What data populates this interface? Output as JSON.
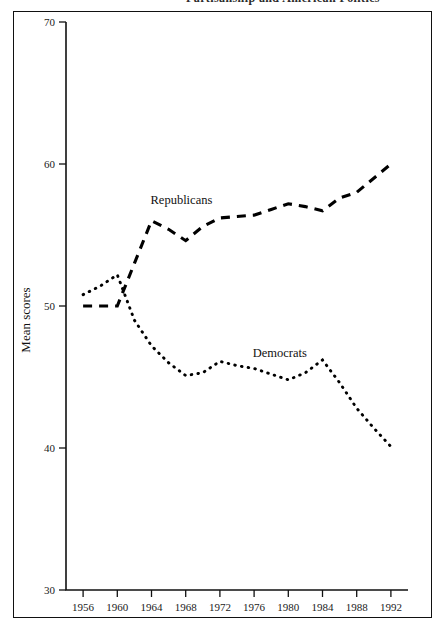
{
  "title": {
    "text": "Partisanship and American Politics",
    "cropped": true
  },
  "axis": {
    "ylabel": "Mean scores",
    "xlabel": "",
    "yticks": [
      30,
      40,
      50,
      60,
      70
    ],
    "xticks": [
      1956,
      1960,
      1964,
      1968,
      1972,
      1976,
      1980,
      1984,
      1988,
      1992
    ]
  },
  "labels": {
    "republicans": "Republicans",
    "democrats": "Democrats"
  },
  "colors": {
    "ink": "#000000",
    "frame": "#111111",
    "background": "#ffffff"
  },
  "chart_data": {
    "type": "line",
    "title": "Partisanship and American Politics",
    "xlabel": "",
    "ylabel": "Mean scores",
    "xlim": [
      1954,
      1994
    ],
    "ylim": [
      30,
      70
    ],
    "yticks": [
      30,
      40,
      50,
      60,
      70
    ],
    "xticks": [
      1956,
      1960,
      1964,
      1968,
      1972,
      1976,
      1980,
      1984,
      1988,
      1992
    ],
    "grid": false,
    "legend_position": "inline-annotation",
    "annotations": [
      {
        "text": "Republicans",
        "x": 1967.5,
        "y": 57.2
      },
      {
        "text": "Democrats",
        "x": 1979.0,
        "y": 46.4
      }
    ],
    "x": [
      1956,
      1958,
      1960,
      1962,
      1964,
      1966,
      1968,
      1970,
      1972,
      1974,
      1976,
      1978,
      1980,
      1982,
      1984,
      1986,
      1988,
      1990,
      1992
    ],
    "series": [
      {
        "name": "Republicans",
        "style": "dashed",
        "values": [
          50.0,
          50.0,
          50.0,
          53.0,
          56.0,
          55.4,
          54.6,
          55.6,
          56.2,
          56.3,
          56.4,
          56.8,
          57.2,
          57.0,
          56.7,
          57.6,
          58.0,
          59.0,
          60.0
        ]
      },
      {
        "name": "Democrats",
        "style": "dotted",
        "values": [
          50.8,
          51.4,
          52.2,
          49.0,
          47.2,
          46.0,
          45.1,
          45.3,
          46.1,
          45.8,
          45.6,
          45.2,
          44.8,
          45.3,
          46.2,
          44.6,
          42.8,
          41.4,
          40.1
        ]
      }
    ]
  }
}
